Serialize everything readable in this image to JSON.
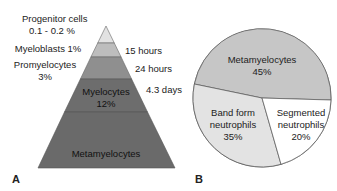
{
  "panel_a": {
    "letter": "A",
    "title": "Neutrophil maturation pyramid",
    "layers": [
      {
        "name": "Progenitor cells",
        "pct": "0.1 - 0.2 %",
        "color": "#e2e2e2"
      },
      {
        "name": "Myeloblasts",
        "pct": "1%",
        "color": "#bdbdbd"
      },
      {
        "name": "Promyelocytes",
        "pct": "3%",
        "color": "#8f8f8f"
      },
      {
        "name": "Myelocytes",
        "pct": "12%",
        "color": "#6d6d6d"
      },
      {
        "name": "Metamyelocytes",
        "pct": "",
        "color": "#6a6a6a"
      }
    ],
    "labels": {
      "progenitor_1": "Progenitor cells",
      "progenitor_2": "0.1 - 0.2 %",
      "myeloblasts": "Myeloblasts 1%",
      "promyelocytes_1": "Promyelocytes",
      "promyelocytes_2": "3%",
      "myelocytes_1": "Myelocytes",
      "myelocytes_2": "12%",
      "metamyelocytes": "Metamyelocytes"
    },
    "durations": [
      "15 hours",
      "24 hours",
      "4.3 days"
    ]
  },
  "panel_b": {
    "letter": "B",
    "slices": [
      {
        "name": "Metamyelocytes",
        "pct": "45%",
        "value": 45,
        "color": "#c6c6c6"
      },
      {
        "name": "Band form neutrophils",
        "pct": "35%",
        "value": 35,
        "color": "#e3e3e3"
      },
      {
        "name": "Segmented neutrophils",
        "pct": "20%",
        "value": 20,
        "color": "#ffffff"
      }
    ],
    "labels": {
      "meta_1": "Metamyelocytes",
      "meta_2": "45%",
      "band_1": "Band form",
      "band_2": "neutrophils",
      "band_3": "35%",
      "seg_1": "Segmented",
      "seg_2": "neutrophils",
      "seg_3": "20%"
    }
  }
}
